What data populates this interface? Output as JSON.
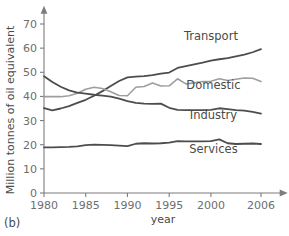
{
  "caption": "(b)",
  "chart_data": {
    "type": "line",
    "title": "",
    "xlabel": "year",
    "ylabel": "Million tonnes of oil equivalent",
    "xlim": [
      1980,
      2008
    ],
    "ylim": [
      0,
      75
    ],
    "grid": false,
    "legend_position": "inline-right",
    "xticks": [
      "1980",
      "1985",
      "1990",
      "1995",
      "2000",
      "2006"
    ],
    "xtick_values": [
      1980,
      1985,
      1990,
      1995,
      2000,
      2006
    ],
    "yticks": [
      "0",
      "10",
      "20",
      "30",
      "40",
      "50",
      "60",
      "70"
    ],
    "ytick_values": [
      0,
      10,
      20,
      30,
      40,
      50,
      60,
      70
    ],
    "x": [
      1980,
      1981,
      1982,
      1983,
      1984,
      1985,
      1986,
      1987,
      1988,
      1989,
      1990,
      1991,
      1992,
      1993,
      1994,
      1995,
      1996,
      1997,
      1998,
      1999,
      2000,
      2001,
      2002,
      2003,
      2004,
      2005,
      2006
    ],
    "series": [
      {
        "name": "Transport",
        "color": "#4d4d4d",
        "width": 1.8,
        "label_x": 2000.0,
        "label_y": 63.5,
        "values": [
          35.2,
          34.2,
          35.0,
          36.0,
          37.3,
          38.6,
          40.3,
          42.2,
          44.3,
          46.4,
          47.9,
          48.2,
          48.4,
          48.8,
          49.4,
          49.9,
          51.8,
          52.6,
          53.3,
          54.0,
          54.8,
          55.4,
          55.9,
          56.6,
          57.3,
          58.3,
          59.6
        ]
      },
      {
        "name": "Domestic",
        "color": "#9e9e9e",
        "width": 1.6,
        "label_x": 2000.3,
        "label_y": 43.0,
        "values": [
          39.9,
          39.9,
          39.9,
          40.3,
          41.3,
          43.0,
          43.8,
          43.3,
          41.9,
          40.4,
          40.3,
          43.8,
          44.1,
          45.6,
          44.3,
          44.4,
          47.3,
          45.2,
          45.6,
          46.2,
          46.3,
          47.3,
          46.6,
          47.1,
          47.6,
          47.5,
          46.2
        ]
      },
      {
        "name": "Industry",
        "color": "#4d4d4d",
        "width": 1.8,
        "label_x": 2000.3,
        "label_y": 30.5,
        "values": [
          48.4,
          46.0,
          44.0,
          42.5,
          41.6,
          41.2,
          40.7,
          40.3,
          39.9,
          39.1,
          38.1,
          37.3,
          37.0,
          36.9,
          37.0,
          35.3,
          34.4,
          34.3,
          34.3,
          34.3,
          34.4,
          35.1,
          34.7,
          34.3,
          34.1,
          33.6,
          32.9
        ]
      },
      {
        "name": "Services",
        "color": "#4d4d4d",
        "width": 1.8,
        "label_x": 2000.3,
        "label_y": 16.5,
        "values": [
          18.9,
          18.9,
          19.0,
          19.1,
          19.3,
          19.8,
          20.0,
          19.9,
          19.8,
          19.6,
          19.4,
          20.4,
          20.6,
          20.5,
          20.6,
          20.9,
          21.5,
          21.4,
          21.4,
          21.4,
          21.5,
          22.2,
          20.6,
          20.3,
          20.4,
          20.5,
          20.3
        ]
      }
    ]
  },
  "colors": {
    "axis": "#7d7d7d",
    "tick_text": "#6e6e6e",
    "label_text": "#4a4a4a",
    "background": "#ffffff"
  }
}
